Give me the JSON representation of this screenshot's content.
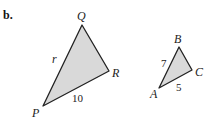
{
  "part_label": "b.",
  "triangle_large": {
    "vertices": {
      "Q": "Q",
      "R": "R",
      "P": "P"
    },
    "side_PQ": "r",
    "side_PR": "10",
    "fill": "#d9d9d9",
    "stroke": "#222222"
  },
  "triangle_small": {
    "vertices": {
      "B": "B",
      "C": "C",
      "A": "A"
    },
    "side_AB": "7",
    "side_AC": "5",
    "fill": "#d9d9d9",
    "stroke": "#222222"
  }
}
